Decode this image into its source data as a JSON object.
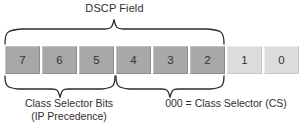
{
  "diagram": {
    "title": "DSCP Field",
    "type": "dscp-bit-field",
    "bits": [
      {
        "label": "7",
        "shade": "dark"
      },
      {
        "label": "6",
        "shade": "dark"
      },
      {
        "label": "5",
        "shade": "dark"
      },
      {
        "label": "4",
        "shade": "dark"
      },
      {
        "label": "3",
        "shade": "dark"
      },
      {
        "label": "2",
        "shade": "dark"
      },
      {
        "label": "1",
        "shade": "light"
      },
      {
        "label": "0",
        "shade": "light"
      }
    ],
    "annotations": {
      "top_brace_label": "DSCP Field",
      "left_caption_line1": "Class Selector Bits",
      "left_caption_line2": "(IP Precedence)",
      "right_caption_line1": "000 = Class Selector (CS)"
    },
    "colors": {
      "dark_cell": "#a8a8a8",
      "light_cell": "#dcdcdc",
      "text": "#2f2f2f",
      "brace_stroke": "#2b2b2b",
      "background": "#ffffff"
    }
  }
}
